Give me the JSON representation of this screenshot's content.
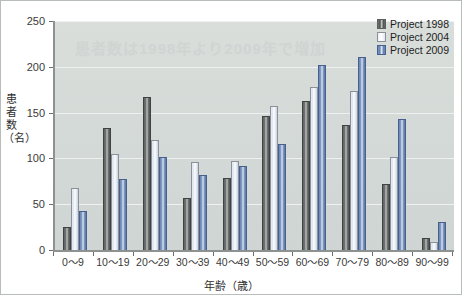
{
  "chart_data": {
    "type": "bar",
    "title": "",
    "xlabel": "年齢（歳）",
    "ylabel": "患者数（名）",
    "ylim": [
      0,
      250
    ],
    "yticks": [
      0,
      50,
      100,
      150,
      200,
      250
    ],
    "grid": true,
    "legend_position": "top-right",
    "categories": [
      "0〜9",
      "10〜19",
      "20〜29",
      "30〜39",
      "40〜49",
      "50〜59",
      "60〜69",
      "70〜79",
      "80〜89",
      "90〜99"
    ],
    "series": [
      {
        "name": "Project 1998",
        "color": "#5c615f",
        "values": [
          25,
          133,
          167,
          57,
          79,
          146,
          163,
          136,
          72,
          13
        ]
      },
      {
        "name": "Project 2004",
        "color": "#f2f5fa",
        "values": [
          68,
          105,
          120,
          96,
          97,
          157,
          178,
          174,
          102,
          9
        ]
      },
      {
        "name": "Project 2009",
        "color": "#7b93bd",
        "values": [
          43,
          78,
          101,
          82,
          92,
          116,
          202,
          211,
          143,
          31
        ]
      }
    ]
  },
  "axis": {
    "y_tick_labels": [
      "0",
      "50",
      "100",
      "150",
      "200",
      "250"
    ],
    "y_axis_title": "患者数（名）",
    "x_axis_title": "年齢（歳）"
  },
  "legend": {
    "items": [
      {
        "label": "Project 1998",
        "swatch": "dark-gray-bar-swatch"
      },
      {
        "label": "Project 2004",
        "swatch": "white-bar-swatch"
      },
      {
        "label": "Project 2009",
        "swatch": "blue-bar-swatch"
      }
    ]
  },
  "watermark": {
    "text": "患者数は1998年より2009年で増加"
  },
  "colors": {
    "plot_background": "#d5dbd8",
    "axis_line": "#8d918f",
    "gridline": "#eef1ef",
    "series_1998": "#5c615f",
    "series_2004": "#f2f5fa",
    "series_2009": "#7b93bd"
  }
}
